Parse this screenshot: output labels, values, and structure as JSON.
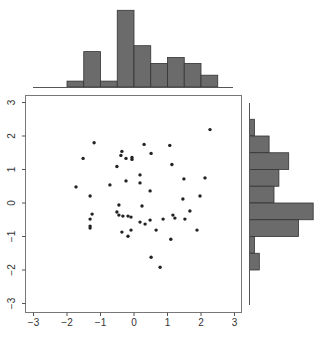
{
  "chart_data": {
    "type": "scatter",
    "title": "",
    "xlabel": "",
    "ylabel": "",
    "xlim": [
      -3.3,
      3.2
    ],
    "ylim": [
      -3.3,
      3.2
    ],
    "x_ticks": [
      "-3",
      "-2",
      "-1",
      "0",
      "1",
      "2",
      "3"
    ],
    "y_ticks": [
      "-3",
      "-2",
      "-1",
      "0",
      "1",
      "2",
      "3"
    ],
    "grid": false,
    "marker_color": "#222222",
    "points": [
      {
        "x": -1.19,
        "y": 1.8
      },
      {
        "x": -1.52,
        "y": 1.33
      },
      {
        "x": -0.36,
        "y": 1.54
      },
      {
        "x": -0.39,
        "y": 1.42
      },
      {
        "x": -0.24,
        "y": 1.33
      },
      {
        "x": -0.06,
        "y": 1.36
      },
      {
        "x": -0.06,
        "y": 1.3
      },
      {
        "x": -0.51,
        "y": 1.09
      },
      {
        "x": -0.24,
        "y": 0.66
      },
      {
        "x": -0.72,
        "y": 0.54
      },
      {
        "x": -1.73,
        "y": 0.48
      },
      {
        "x": -1.31,
        "y": 0.21
      },
      {
        "x": -0.45,
        "y": -0.06
      },
      {
        "x": 2.27,
        "y": 2.19
      },
      {
        "x": 0.3,
        "y": 1.75
      },
      {
        "x": 1.07,
        "y": 1.72
      },
      {
        "x": 0.51,
        "y": 1.48
      },
      {
        "x": 1.13,
        "y": 1.15
      },
      {
        "x": 0.18,
        "y": 0.84
      },
      {
        "x": 1.49,
        "y": 0.72
      },
      {
        "x": 2.12,
        "y": 0.75
      },
      {
        "x": 0.18,
        "y": 0.6
      },
      {
        "x": 0.48,
        "y": 0.36
      },
      {
        "x": 1.97,
        "y": 0.21
      },
      {
        "x": 1.46,
        "y": 0.12
      },
      {
        "x": 0.24,
        "y": -0.09
      },
      {
        "x": -0.45,
        "y": -0.36
      },
      {
        "x": -0.51,
        "y": -0.27
      },
      {
        "x": -1.25,
        "y": -0.33
      },
      {
        "x": -0.33,
        "y": -0.39
      },
      {
        "x": -0.18,
        "y": -0.39
      },
      {
        "x": -0.09,
        "y": -0.42
      },
      {
        "x": -1.31,
        "y": -0.48
      },
      {
        "x": -1.31,
        "y": -0.69
      },
      {
        "x": -1.31,
        "y": -0.75
      },
      {
        "x": -0.09,
        "y": -0.81
      },
      {
        "x": -0.36,
        "y": -0.87
      },
      {
        "x": -0.18,
        "y": -0.99
      },
      {
        "x": 1.67,
        "y": -0.24
      },
      {
        "x": 1.16,
        "y": -0.36
      },
      {
        "x": 1.22,
        "y": -0.45
      },
      {
        "x": 0.87,
        "y": -0.48
      },
      {
        "x": 1.52,
        "y": -0.48
      },
      {
        "x": 0.48,
        "y": -0.51
      },
      {
        "x": 0.18,
        "y": -0.57
      },
      {
        "x": 0.33,
        "y": -0.63
      },
      {
        "x": 0.66,
        "y": -0.81
      },
      {
        "x": 1.88,
        "y": -0.81
      },
      {
        "x": 1.1,
        "y": -1.08
      },
      {
        "x": 0.51,
        "y": -1.62
      },
      {
        "x": 0.78,
        "y": -1.92
      }
    ],
    "marginal_x_histogram": {
      "bin_edges": [
        -2.0,
        -1.5,
        -1.0,
        -0.5,
        0.0,
        0.5,
        1.0,
        1.5,
        2.0,
        2.5
      ],
      "counts": [
        1,
        6,
        1,
        13,
        7,
        4,
        5,
        4,
        2
      ]
    },
    "marginal_y_histogram": {
      "bin_edges": [
        2.5,
        2.0,
        1.5,
        1.0,
        0.5,
        0.0,
        -0.5,
        -1.0,
        -1.5,
        -2.0
      ],
      "counts": [
        1,
        4,
        8,
        6,
        5,
        13,
        10,
        1,
        2
      ]
    },
    "bar_fill": "#6b6b6b",
    "bar_stroke": "#333333"
  }
}
